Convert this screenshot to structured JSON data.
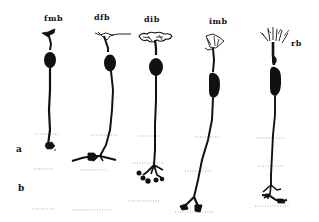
{
  "figure": {
    "colors": {
      "ink": "#111111",
      "background": "#ffffff",
      "dotted_line": "#9a9a9a"
    }
  },
  "cells": [
    {
      "id": "fmb",
      "label": "fmb"
    },
    {
      "id": "dfb",
      "label": "dfb"
    },
    {
      "id": "dib",
      "label": "dib"
    },
    {
      "id": "imb",
      "label": "imb"
    },
    {
      "id": "rb",
      "label": "rb"
    }
  ],
  "layers": [
    {
      "id": "a",
      "label": "a"
    },
    {
      "id": "b",
      "label": "b"
    }
  ]
}
